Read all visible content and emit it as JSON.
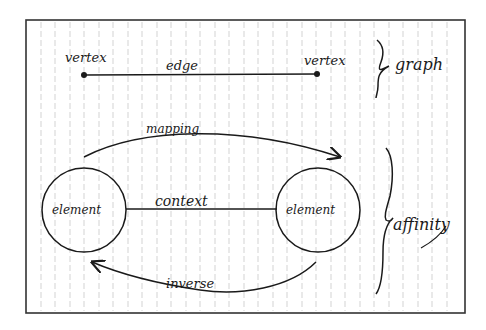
{
  "diagram": {
    "graph_section": {
      "vertex_left_label": "vertex",
      "vertex_right_label": "vertex",
      "edge_label": "edge",
      "brace_label": "graph"
    },
    "affinity_section": {
      "element_left_label": "element",
      "element_right_label": "element",
      "context_label": "context",
      "mapping_label": "mapping",
      "inverse_label": "inverse",
      "brace_label": "affinity"
    },
    "colors": {
      "ink": "#1a1a1a",
      "paper": "#ffffff",
      "rule_lines": "#c8c8c8",
      "frame": "#333333"
    }
  }
}
